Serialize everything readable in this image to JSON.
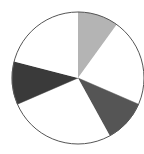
{
  "figure": {
    "background_color": "#ffffff",
    "caption": "",
    "caption_visible": false
  },
  "chart_data": {
    "type": "pie",
    "title": "",
    "subtitle": "",
    "xlabel": "",
    "ylabel": "",
    "legend": [],
    "legend_position": "none",
    "grid": false,
    "labels_shown": false,
    "start_angle_deg": 0,
    "direction": "clockwise",
    "center": {
      "x": 78,
      "y": 78
    },
    "radius": 66,
    "outline_color": "#555555",
    "outline_width": 1,
    "categories": [
      "Slice 1",
      "Slice 2",
      "Slice 3",
      "Slice 4",
      "Slice 5",
      "Slice 6"
    ],
    "values": [
      10,
      21.5,
      10.5,
      26.5,
      10.5,
      21
    ],
    "colors": [
      "#b4b4b4",
      "#ffffff",
      "#555555",
      "#ffffff",
      "#3a3a3a",
      "#ffffff"
    ],
    "slices": [
      {
        "label": "Slice 1",
        "value": 10,
        "percent": "10%",
        "color": "#b4b4b4",
        "start_deg": 0,
        "end_deg": 36
      },
      {
        "label": "Slice 2",
        "value": 21.5,
        "percent": "21.5%",
        "color": "#ffffff",
        "start_deg": 36,
        "end_deg": 113.4
      },
      {
        "label": "Slice 3",
        "value": 10.5,
        "percent": "10.5%",
        "color": "#555555",
        "start_deg": 113.4,
        "end_deg": 151.2
      },
      {
        "label": "Slice 4",
        "value": 26.5,
        "percent": "26.5%",
        "color": "#ffffff",
        "start_deg": 151.2,
        "end_deg": 246.6
      },
      {
        "label": "Slice 5",
        "value": 10.5,
        "percent": "10.5%",
        "color": "#3a3a3a",
        "start_deg": 246.6,
        "end_deg": 284.4
      },
      {
        "label": "Slice 6",
        "value": 21,
        "percent": "21%",
        "color": "#ffffff",
        "start_deg": 284.4,
        "end_deg": 360
      }
    ]
  }
}
